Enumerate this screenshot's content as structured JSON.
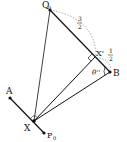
{
  "diagram": {
    "points": {
      "Q0": {
        "label": "Q",
        "sub": "0",
        "x": 50,
        "y": 10
      },
      "X1p": {
        "label": "X'",
        "sub": "1",
        "x": 95,
        "y": 57
      },
      "B": {
        "label": "B",
        "x": 110,
        "y": 72
      },
      "A": {
        "label": "A",
        "x": 10,
        "y": 98
      },
      "X": {
        "label": "X",
        "x": 34,
        "y": 121
      },
      "P0": {
        "label": "P",
        "sub": "0",
        "x": 44,
        "y": 133
      }
    },
    "labels": {
      "q": "Q",
      "q_sub": "0",
      "xprime": "X'",
      "xprime_sub": "1",
      "b": "B",
      "a": "A",
      "x": "X",
      "p": "P",
      "p_sub": "0",
      "frac_big_num": "3",
      "frac_big_den": "2",
      "frac_small_num": "1",
      "frac_small_den": "2",
      "angle": "θ''"
    },
    "colors": {
      "line": "#111111",
      "dashed": "#888888"
    }
  }
}
